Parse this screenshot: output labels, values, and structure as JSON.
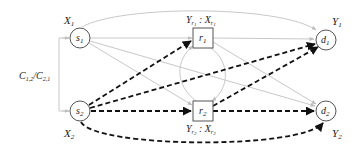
{
  "diagram": {
    "type": "relay network flow graph",
    "colors": {
      "light_edge": "#c8c8c8",
      "dashed_edge": "#111111",
      "node_stroke": "#555555",
      "text": "#222222"
    },
    "nodes": [
      {
        "id": "s1",
        "shape": "circle",
        "label": "s",
        "sub": "1",
        "outer_label": "X",
        "outer_sub": "1"
      },
      {
        "id": "s2",
        "shape": "circle",
        "label": "s",
        "sub": "2",
        "outer_label": "X",
        "outer_sub": "2"
      },
      {
        "id": "r1",
        "shape": "square",
        "label": "r",
        "sub": "1",
        "outer_label": "Y_r1 : X_r1"
      },
      {
        "id": "r2",
        "shape": "square",
        "label": "r",
        "sub": "2",
        "outer_label": "Y_r2 : X_r2"
      },
      {
        "id": "d1",
        "shape": "circle",
        "label": "d",
        "sub": "1",
        "outer_label": "Y",
        "outer_sub": "1"
      },
      {
        "id": "d2",
        "shape": "circle",
        "label": "d",
        "sub": "2",
        "outer_label": "Y",
        "outer_sub": "2"
      }
    ],
    "side_label": {
      "text": "C",
      "parts": [
        "C",
        "1,2",
        "/C",
        "2,1"
      ]
    },
    "edges_light": [
      [
        "s1",
        "d1",
        "arc-top"
      ],
      [
        "s1",
        "r1"
      ],
      [
        "s1",
        "d2"
      ],
      [
        "s1",
        "r2"
      ],
      [
        "r1",
        "d1"
      ],
      [
        "r1",
        "d2"
      ],
      [
        "r1",
        "r2",
        "curve"
      ],
      [
        "r2",
        "r1",
        "curve"
      ],
      [
        "side",
        "s1"
      ],
      [
        "side",
        "s2"
      ]
    ],
    "edges_dashed": [
      [
        "s2",
        "r1"
      ],
      [
        "s2",
        "d1"
      ],
      [
        "s2",
        "r2"
      ],
      [
        "r2",
        "d1"
      ],
      [
        "r2",
        "d2"
      ],
      [
        "s2",
        "d2",
        "arc-bottom"
      ]
    ]
  }
}
